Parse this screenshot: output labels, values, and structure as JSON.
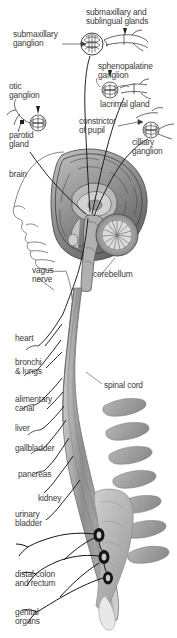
{
  "figure": {
    "domain": "anatomical-illustration",
    "background_color": "#ffffff",
    "text_color": "#3b3b3b",
    "line_color": "#1a1a1a",
    "palette": {
      "brain_dark": "#5c5c5c",
      "brain_mid": "#8a8a8a",
      "brain_light": "#b4b4b4",
      "brain_pale": "#d4d4d4",
      "cord_gray": "#9a9a9a",
      "cord_light": "#c8c8c8",
      "vertebra_gray": "#a8a8a8",
      "vertebra_dark": "#8f8f8f",
      "ganglion_dark": "#1c1c1c",
      "scribble": "#4a4a4a",
      "outline": "#707070"
    }
  },
  "labels": [
    {
      "id": "submaxillary-sublingual-glands",
      "text": "submaxillary and\nsublingual glands",
      "x": 86,
      "y": 8,
      "align": "left"
    },
    {
      "id": "submaxillary-ganglion",
      "text": "submaxillary\nganglion",
      "x": 13,
      "y": 30,
      "align": "left"
    },
    {
      "id": "sphenopalatine-ganglion",
      "text": "sphenopalatine\nganglion",
      "x": 98,
      "y": 62,
      "align": "left"
    },
    {
      "id": "otic-ganglion",
      "text": "otic\nganglion",
      "x": 9,
      "y": 82,
      "align": "left"
    },
    {
      "id": "lacrimal-gland",
      "text": "lacrimal gland",
      "x": 100,
      "y": 100,
      "align": "left"
    },
    {
      "id": "constrictor-of-pupil",
      "text": "constrictor\nof pupil",
      "x": 79,
      "y": 117,
      "align": "left"
    },
    {
      "id": "parotid-gland",
      "text": "parotid\ngland",
      "x": 9,
      "y": 131,
      "align": "left"
    },
    {
      "id": "ciliary-ganglion",
      "text": "cilliary\nganglion",
      "x": 132,
      "y": 138,
      "align": "left"
    },
    {
      "id": "brain",
      "text": "brain",
      "x": 9,
      "y": 170,
      "align": "left"
    },
    {
      "id": "vagus-nerve",
      "text": "vagus\nnerve",
      "x": 32,
      "y": 266,
      "align": "left"
    },
    {
      "id": "cerebellum",
      "text": "cerebellum",
      "x": 93,
      "y": 270,
      "align": "left"
    },
    {
      "id": "heart",
      "text": "heart",
      "x": 15,
      "y": 334,
      "align": "left"
    },
    {
      "id": "bronchi-lungs",
      "text": "bronchi\n& lungs",
      "x": 15,
      "y": 358,
      "align": "left"
    },
    {
      "id": "spinal-cord",
      "text": "spinal cord",
      "x": 104,
      "y": 381,
      "align": "left"
    },
    {
      "id": "alimentary-canal",
      "text": "alimentary\ncanal",
      "x": 15,
      "y": 395,
      "align": "left"
    },
    {
      "id": "liver",
      "text": "liver",
      "x": 15,
      "y": 424,
      "align": "left"
    },
    {
      "id": "gallbladder",
      "text": "gallbladder",
      "x": 15,
      "y": 444,
      "align": "left"
    },
    {
      "id": "pancreas",
      "text": "pancreas",
      "x": 18,
      "y": 470,
      "align": "left"
    },
    {
      "id": "kidney",
      "text": "kidney",
      "x": 38,
      "y": 494,
      "align": "left"
    },
    {
      "id": "urinary-bladder",
      "text": "urinary\nbladder",
      "x": 15,
      "y": 510,
      "align": "left"
    },
    {
      "id": "distal-colon-rectum",
      "text": "distal colon\nand rectum",
      "x": 15,
      "y": 570,
      "align": "left"
    },
    {
      "id": "genital-organs",
      "text": "genital\norgans",
      "x": 15,
      "y": 608,
      "align": "left"
    }
  ],
  "structures": {
    "brain_sagittal_section": "grayscale mid-sagittal section of the brain with cerebral cortex, corpus callosum, thalamus and brainstem",
    "cerebellum": "striated arbor-vitae pattern posterior-inferior to the cerebrum",
    "face_profile": "left-facing human head outline with nose, lips and chin in line art",
    "spinal_cord": "long gray shaded cord descending from brainstem to sacrum",
    "vertebral_column": "series of gray vertebral bodies and spinous processes on the right of the cord",
    "sacral_ganglia": "three dark filled ovals on the lower cord",
    "cranial_ganglia": "four dense scribbled ganglion clusters (submaxillary, sphenopalatine, otic, ciliary)",
    "nerve_fibers": "thin dark curved lines running from brainstem and sacral cord to target organs"
  }
}
